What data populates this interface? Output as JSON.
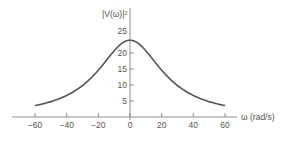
{
  "chart_data": {
    "type": "line",
    "title": "",
    "ylabel": "|V(ω)|²",
    "xlabel": "ω (rad/s)",
    "x_ticks": [
      -60,
      -40,
      -20,
      0,
      20,
      40,
      60
    ],
    "y_ticks": [
      5,
      10,
      15,
      20,
      25
    ],
    "xlim": [
      -72,
      72
    ],
    "ylim": [
      0,
      28
    ],
    "grid": false,
    "legend": null,
    "series": [
      {
        "name": "|V(ω)|²",
        "x": [
          -60,
          -50,
          -40,
          -30,
          -20,
          -10,
          0,
          10,
          20,
          30,
          40,
          50,
          60
        ],
        "values": [
          3.6,
          4.8,
          6.7,
          9.8,
          14.6,
          20.7,
          24,
          20.7,
          14.6,
          9.8,
          6.7,
          4.8,
          3.6
        ]
      }
    ],
    "color": "#555555"
  },
  "labels": {
    "y_axis": "|V(ω)|²",
    "x_axis": "ω (rad/s)",
    "x_ticks": [
      "−60",
      "−40",
      "−20",
      "0",
      "20",
      "40",
      "60"
    ],
    "y_ticks": [
      "5",
      "10",
      "15",
      "20",
      "25"
    ]
  }
}
